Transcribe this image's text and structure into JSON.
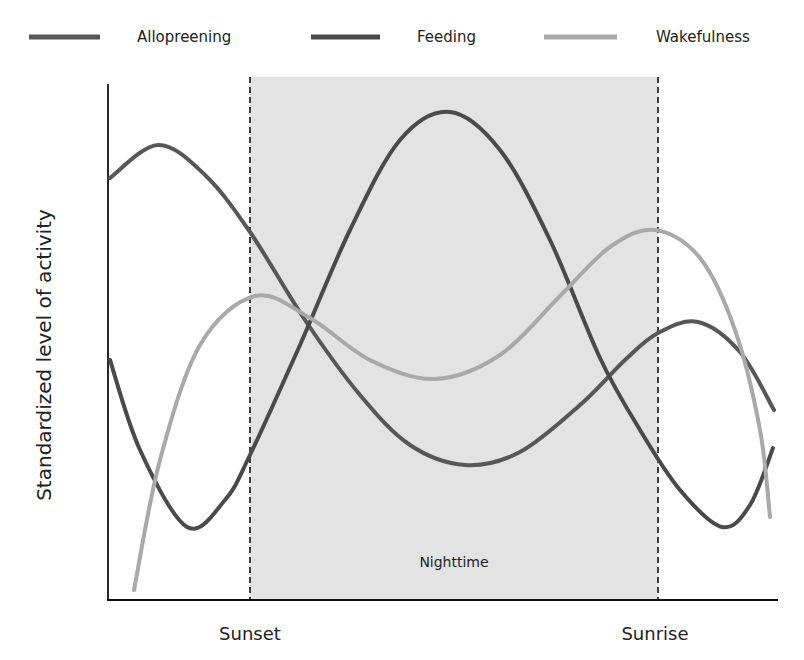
{
  "chart_data": {
    "type": "line",
    "title": "",
    "xlabel": "",
    "ylabel": "Standardized level of activity",
    "x_tick_labels": [
      {
        "label": "Sunset",
        "x": 250
      },
      {
        "label": "Sunrise",
        "x": 655
      }
    ],
    "grid": false,
    "legend_position": "top",
    "shaded_region": {
      "label": "Nighttime",
      "x_start": 250,
      "x_end": 658,
      "color": "#e3e3e3",
      "boundary_style": "dashed"
    },
    "axis": {
      "x0": 108,
      "x1": 778,
      "y_top": 84,
      "y_bottom": 600
    },
    "series": [
      {
        "name": "Allopreening",
        "color": "#575757",
        "points": [
          [
            110,
            178
          ],
          [
            158,
            145
          ],
          [
            205,
            175
          ],
          [
            250,
            232
          ],
          [
            305,
            320
          ],
          [
            360,
            395
          ],
          [
            410,
            445
          ],
          [
            465,
            465
          ],
          [
            520,
            452
          ],
          [
            580,
            405
          ],
          [
            625,
            360
          ],
          [
            658,
            333
          ],
          [
            698,
            322
          ],
          [
            740,
            352
          ],
          [
            774,
            410
          ]
        ]
      },
      {
        "name": "Feeding",
        "color": "#4a4a4a",
        "points": [
          [
            110,
            360
          ],
          [
            140,
            450
          ],
          [
            187,
            527
          ],
          [
            225,
            500
          ],
          [
            250,
            455
          ],
          [
            300,
            345
          ],
          [
            350,
            230
          ],
          [
            400,
            140
          ],
          [
            450,
            112
          ],
          [
            500,
            150
          ],
          [
            550,
            240
          ],
          [
            600,
            358
          ],
          [
            640,
            430
          ],
          [
            680,
            490
          ],
          [
            722,
            527
          ],
          [
            750,
            505
          ],
          [
            773,
            448
          ]
        ]
      },
      {
        "name": "Wakefulness",
        "color": "#a9a9a9",
        "points": [
          [
            134,
            590
          ],
          [
            160,
            460
          ],
          [
            200,
            345
          ],
          [
            255,
            296
          ],
          [
            310,
            318
          ],
          [
            370,
            360
          ],
          [
            435,
            379
          ],
          [
            500,
            355
          ],
          [
            560,
            296
          ],
          [
            610,
            247
          ],
          [
            655,
            230
          ],
          [
            700,
            258
          ],
          [
            735,
            330
          ],
          [
            760,
            430
          ],
          [
            770,
            517
          ]
        ]
      }
    ]
  },
  "legend": {
    "items": [
      {
        "label": "Allopreening",
        "color": "#575757",
        "line_x1": 29,
        "line_x2": 100,
        "text_x": 137
      },
      {
        "label": "Feeding",
        "color": "#4a4a4a",
        "line_x1": 311,
        "line_x2": 380,
        "text_x": 417
      },
      {
        "label": "Wakefulness",
        "color": "#a9a9a9",
        "line_x1": 544,
        "line_x2": 617,
        "text_x": 656
      }
    ]
  },
  "labels": {
    "y_axis": "Standardized level of activity",
    "sunset": "Sunset",
    "sunrise": "Sunrise",
    "nighttime": "Nighttime"
  }
}
